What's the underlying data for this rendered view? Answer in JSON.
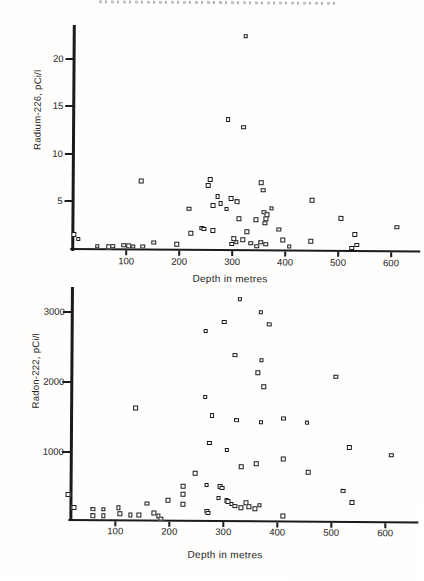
{
  "page": {
    "background": "#fffefd",
    "ink": "#1b1b1b",
    "cropped_header_legible": false
  },
  "chart_data": [
    {
      "type": "scatter",
      "title": "",
      "ylabel": "Radium-226, pCi/l",
      "xlabel": "Depth in metres",
      "xlim": [
        0,
        653
      ],
      "ylim": [
        0,
        23.5
      ],
      "xticks": [
        100,
        200,
        300,
        400,
        500,
        600
      ],
      "yticks": [
        5,
        10,
        15,
        20
      ],
      "legend": null,
      "grid": false,
      "marker": "open-square",
      "points": [
        [
          2,
          1.4
        ],
        [
          10,
          0.9
        ],
        [
          46,
          0.2
        ],
        [
          68,
          0.15
        ],
        [
          75,
          0.2
        ],
        [
          96,
          0.3
        ],
        [
          105,
          0.25
        ],
        [
          114,
          0.2
        ],
        [
          128,
          7.1
        ],
        [
          132,
          0.2
        ],
        [
          153,
          0.6
        ],
        [
          196,
          0.45
        ],
        [
          219,
          4.2
        ],
        [
          222,
          1.6
        ],
        [
          243,
          2.2
        ],
        [
          247,
          2.1
        ],
        [
          255,
          6.7
        ],
        [
          258,
          7.3
        ],
        [
          264,
          4.6
        ],
        [
          264,
          1.9
        ],
        [
          272,
          5.5
        ],
        [
          278,
          4.8
        ],
        [
          289,
          4.2
        ],
        [
          291,
          13.7
        ],
        [
          298,
          5.3
        ],
        [
          300,
          0.5
        ],
        [
          304,
          1.1
        ],
        [
          308,
          0.7
        ],
        [
          309,
          5.0
        ],
        [
          313,
          3.2
        ],
        [
          321,
          0.95
        ],
        [
          321,
          12.9
        ],
        [
          323,
          22.5
        ],
        [
          328,
          1.8
        ],
        [
          336,
          0.6
        ],
        [
          345,
          3.1
        ],
        [
          347,
          0.3
        ],
        [
          355,
          7.0
        ],
        [
          355,
          0.7
        ],
        [
          358,
          6.2
        ],
        [
          360,
          3.9
        ],
        [
          362,
          2.7
        ],
        [
          364,
          3.2
        ],
        [
          364,
          0.5
        ],
        [
          366,
          3.6
        ],
        [
          374,
          4.3
        ],
        [
          389,
          2.1
        ],
        [
          396,
          0.95
        ],
        [
          408,
          0.3
        ],
        [
          449,
          0.85
        ],
        [
          451,
          5.2
        ],
        [
          505,
          3.3
        ],
        [
          526,
          0.2
        ],
        [
          532,
          1.6
        ],
        [
          536,
          0.5
        ],
        [
          611,
          2.4
        ]
      ]
    },
    {
      "type": "scatter",
      "title": "",
      "ylabel": "Radon-222, pCi/l",
      "xlabel": "Depth in metres",
      "xlim": [
        0,
        655
      ],
      "ylim": [
        0,
        3350
      ],
      "xticks": [
        100,
        200,
        300,
        400,
        500,
        600
      ],
      "yticks": [
        1000,
        2000,
        3000
      ],
      "legend": null,
      "grid": false,
      "marker": "open-square",
      "points": [
        [
          13,
          385
        ],
        [
          24,
          200
        ],
        [
          59,
          180
        ],
        [
          59,
          90
        ],
        [
          78,
          180
        ],
        [
          78,
          90
        ],
        [
          106,
          200
        ],
        [
          109,
          115
        ],
        [
          128,
          100
        ],
        [
          137,
          1630
        ],
        [
          144,
          100
        ],
        [
          159,
          270
        ],
        [
          172,
          130
        ],
        [
          180,
          90
        ],
        [
          185,
          55
        ],
        [
          198,
          315
        ],
        [
          226,
          515
        ],
        [
          226,
          400
        ],
        [
          226,
          257
        ],
        [
          248,
          700
        ],
        [
          265,
          2745
        ],
        [
          265,
          1800
        ],
        [
          269,
          540
        ],
        [
          270,
          170
        ],
        [
          272,
          140
        ],
        [
          274,
          1140
        ],
        [
          278,
          1530
        ],
        [
          291,
          355
        ],
        [
          294,
          515
        ],
        [
          298,
          495
        ],
        [
          300,
          2870
        ],
        [
          306,
          1040
        ],
        [
          306,
          315
        ],
        [
          309,
          300
        ],
        [
          315,
          270
        ],
        [
          320,
          2400
        ],
        [
          322,
          240
        ],
        [
          324,
          1470
        ],
        [
          328,
          3200
        ],
        [
          333,
          800
        ],
        [
          333,
          215
        ],
        [
          342,
          285
        ],
        [
          348,
          230
        ],
        [
          359,
          200
        ],
        [
          361,
          845
        ],
        [
          363,
          2145
        ],
        [
          367,
          3015
        ],
        [
          367,
          255
        ],
        [
          369,
          2330
        ],
        [
          369,
          1440
        ],
        [
          374,
          1950
        ],
        [
          383,
          2845
        ],
        [
          411,
          1500
        ],
        [
          411,
          915
        ],
        [
          411,
          100
        ],
        [
          454,
          1440
        ],
        [
          457,
          730
        ],
        [
          507,
          2100
        ],
        [
          522,
          470
        ],
        [
          533,
          1090
        ],
        [
          539,
          300
        ],
        [
          611,
          985
        ]
      ]
    }
  ]
}
